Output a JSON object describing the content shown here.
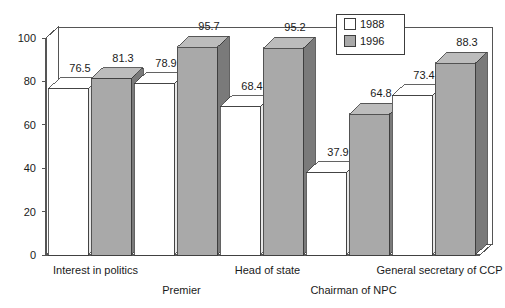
{
  "chart_data": {
    "type": "bar",
    "title": "",
    "subtitle": "",
    "xlabel": "",
    "ylabel": "",
    "ylim": [
      0,
      100
    ],
    "yticks": [
      "0",
      "20",
      "40",
      "60",
      "80",
      "100"
    ],
    "ytick_values": [
      0,
      20,
      40,
      60,
      80,
      100
    ],
    "grid": false,
    "legend_position": "top-right",
    "three_d": true,
    "categories": [
      "Interest in politics",
      "Premier",
      "Head of state",
      "Chairman of NPC",
      "General secretary of CCP"
    ],
    "series": [
      {
        "name": "1988",
        "color": "#ffffff",
        "values": [
          76.5,
          78.9,
          68.4,
          37.9,
          73.4
        ],
        "labels": [
          "76.5",
          "78.9",
          "68.4",
          "37.9",
          "73.4"
        ]
      },
      {
        "name": "1996",
        "color": "#a9a9a9",
        "values": [
          81.3,
          95.7,
          95.2,
          64.8,
          88.3
        ],
        "labels": [
          "81.3",
          "95.7",
          "95.2",
          "64.8",
          "88.3"
        ]
      }
    ]
  },
  "legend": {
    "entries": [
      {
        "label": "1988",
        "swatch": "#ffffff"
      },
      {
        "label": "1996",
        "swatch": "#a9a9a9"
      }
    ]
  },
  "colors": {
    "bar_1988_face": "#ffffff",
    "bar_1988_top": "#ffffff",
    "bar_1988_side": "#e8e8e8",
    "bar_1996_face": "#a9a9a9",
    "bar_1996_top": "#bcbcbc",
    "bar_1996_side": "#7a7a7a",
    "axis": "#555555",
    "text": "#1a1a1a",
    "background": "#ffffff"
  },
  "axis": {
    "y_ticks": [
      {
        "value": 100,
        "label": "100"
      },
      {
        "value": 80,
        "label": "80"
      },
      {
        "value": 60,
        "label": "60"
      },
      {
        "value": 40,
        "label": "40"
      },
      {
        "value": 20,
        "label": "20"
      },
      {
        "value": 0,
        "label": "0"
      }
    ]
  },
  "category_rows": [
    {
      "label": "Interest in politics",
      "row": 0
    },
    {
      "label": "Premier",
      "row": 1
    },
    {
      "label": "Head of state",
      "row": 0
    },
    {
      "label": "Chairman of NPC",
      "row": 1
    },
    {
      "label": "General secretary of CCP",
      "row": 0
    }
  ]
}
